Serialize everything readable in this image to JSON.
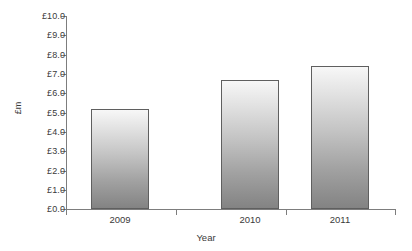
{
  "chart_data": {
    "type": "bar",
    "title": "",
    "categories": [
      "2009",
      "2010",
      "2011"
    ],
    "values": [
      5.2,
      6.7,
      7.4
    ],
    "xlabel": "Year",
    "ylabel": "£m",
    "ylim": [
      0,
      10
    ],
    "yticks": [
      0,
      1,
      2,
      3,
      4,
      5,
      6,
      7,
      8,
      9,
      10
    ],
    "ytick_labels": [
      "£0.0",
      "£1.0",
      "£2.0",
      "£3.0",
      "£4.0",
      "£5.0",
      "£6.0",
      "£7.0",
      "£8.0",
      "£9.0",
      "£10.0"
    ],
    "grid": false,
    "legend": false,
    "legend_position": "none",
    "series": [
      {
        "name": "£m",
        "values": [
          5.2,
          6.7,
          7.4
        ]
      }
    ],
    "bar_fill_top_color": "#f7f7f7",
    "bar_fill_bottom_color": "#838383",
    "bar_border_color": "#5f5f5f",
    "axis_color": "#7d7d7d",
    "text_color": "#3a3a3a",
    "background_color": "#ffffff"
  }
}
